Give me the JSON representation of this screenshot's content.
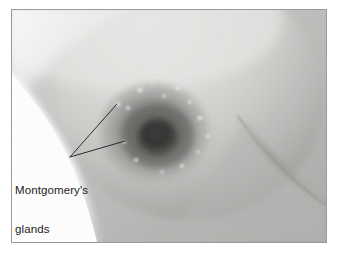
{
  "figure": {
    "type": "anatomical-photograph",
    "caption_lines": [
      "Montgomery's",
      "glands"
    ],
    "caption_full": "Montgomery's glands"
  },
  "annotation": {
    "leader_icon": "leader-line-icon",
    "origin": {
      "x": 69,
      "y": 156
    },
    "targets": [
      {
        "name": "montgomery-gland-upper",
        "x": 116,
        "y": 104
      },
      {
        "name": "montgomery-gland-lower",
        "x": 124,
        "y": 140
      }
    ],
    "stroke": "#1a1a1a",
    "stroke_width": 0.9
  },
  "frame": {
    "border_color": "#9a9a9a",
    "background": "#ffffff",
    "left": 11,
    "top": 9,
    "width": 316,
    "height": 234
  },
  "palette": {
    "page_white": "#ffffff",
    "skin_highlight": "#e8e8e6",
    "skin_light": "#dcdcda",
    "skin_mid": "#c3c3c1",
    "skin_shadow": "#a0a09e",
    "torso_grey": "#b2b2b0",
    "areola": "#6e6e6c",
    "areola_dark": "#4a4a48",
    "nipple": "#2c2c2a",
    "fold_line": "#8a8a88",
    "caption_text": "#1c1c1c"
  },
  "features": {
    "breast_mound": {
      "cx": 188,
      "cy": 96,
      "rx": 132,
      "ry": 118
    },
    "areola": {
      "cx": 152,
      "cy": 131,
      "rx": 48,
      "ry": 44
    },
    "nipple": {
      "cx": 156,
      "cy": 136,
      "rx": 19,
      "ry": 17
    },
    "inframammary_fold": "sweeping curve lower-right",
    "montgomery_tubercles_count": 14
  }
}
